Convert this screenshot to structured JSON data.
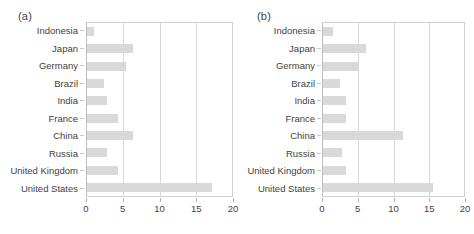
{
  "figure": {
    "background": "#ffffff",
    "bar_color": "#d9d9d9",
    "grid_color": "#d9d9d9",
    "text_color": "#3f3f3f"
  },
  "panels": [
    {
      "tag": "(a)",
      "chart_data": {
        "type": "bar",
        "orientation": "horizontal",
        "title": "",
        "xlabel": "",
        "ylabel": "",
        "xlim": [
          0,
          20
        ],
        "xticks": [
          0,
          5,
          10,
          15,
          20
        ],
        "xtick_labels": [
          "0",
          "5",
          "10",
          "15",
          "20"
        ],
        "grid": true,
        "legend": false,
        "categories": [
          "Indonesia",
          "Japan",
          "Germany",
          "Brazil",
          "India",
          "France",
          "China",
          "Russia",
          "United Kingdom",
          "United States"
        ],
        "values": [
          0.9,
          6.4,
          5.4,
          2.4,
          2.8,
          4.3,
          6.4,
          2.7,
          4.3,
          17.3
        ]
      }
    },
    {
      "tag": "(b)",
      "chart_data": {
        "type": "bar",
        "orientation": "horizontal",
        "title": "",
        "xlabel": "",
        "ylabel": "",
        "xlim": [
          0,
          20
        ],
        "xticks": [
          0,
          5,
          10,
          15,
          20
        ],
        "xtick_labels": [
          "0",
          "5",
          "10",
          "15",
          "20"
        ],
        "grid": true,
        "legend": false,
        "categories": [
          "Indonesia",
          "Japan",
          "Germany",
          "Brazil",
          "India",
          "France",
          "China",
          "Russia",
          "United Kingdom",
          "United States"
        ],
        "values": [
          1.4,
          6.1,
          5.0,
          2.4,
          3.3,
          3.3,
          11.4,
          2.7,
          3.2,
          15.6
        ]
      }
    }
  ]
}
